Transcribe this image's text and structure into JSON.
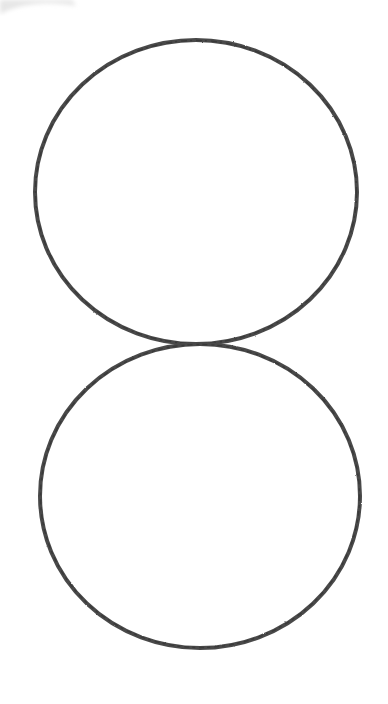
{
  "drawing": {
    "description": "Pencil sketch of two circles stacked vertically, touching at one point (figure-eight / snowman outline)",
    "background": "#ffffff",
    "stroke_color": "#4a4a4a",
    "stroke_width": 4,
    "shapes": [
      {
        "name": "top-circle",
        "cx": 196,
        "cy": 192,
        "rx": 161,
        "ry": 152
      },
      {
        "name": "bottom-circle",
        "cx": 200,
        "cy": 496,
        "rx": 160,
        "ry": 152
      }
    ],
    "corner_smudge": {
      "color": "#e4e4e4",
      "position": "top-left"
    }
  }
}
